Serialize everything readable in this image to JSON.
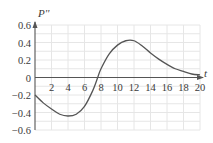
{
  "chart_data": {
    "type": "line",
    "title": "",
    "xlabel": "t",
    "ylabel": "P''",
    "xlim": [
      0,
      20
    ],
    "ylim": [
      -0.6,
      0.6
    ],
    "grid": true,
    "x_ticks": [
      2,
      4,
      6,
      8,
      10,
      12,
      14,
      16,
      18,
      20
    ],
    "y_ticks": [
      0.6,
      0.4,
      0.2,
      0,
      -0.2,
      -0.4,
      -0.6
    ],
    "x_tick_labels": [
      "2",
      "4",
      "6",
      "8",
      "10",
      "12",
      "14",
      "16",
      "18",
      "20"
    ],
    "y_tick_labels": [
      "0.6",
      "0.4",
      "0.2",
      "0",
      "−0.2",
      "−0.4",
      "−0.6"
    ],
    "series": [
      {
        "name": "P''",
        "x": [
          0,
          1,
          2,
          3,
          4,
          5,
          6,
          7,
          7.6,
          8,
          9,
          10,
          11,
          12,
          13,
          14,
          15,
          16,
          17,
          18,
          19,
          20
        ],
        "values": [
          -0.2,
          -0.29,
          -0.36,
          -0.42,
          -0.44,
          -0.42,
          -0.33,
          -0.15,
          0,
          0.1,
          0.27,
          0.37,
          0.42,
          0.42,
          0.36,
          0.28,
          0.21,
          0.15,
          0.1,
          0.07,
          0.04,
          0.03
        ]
      }
    ],
    "legend": null
  }
}
